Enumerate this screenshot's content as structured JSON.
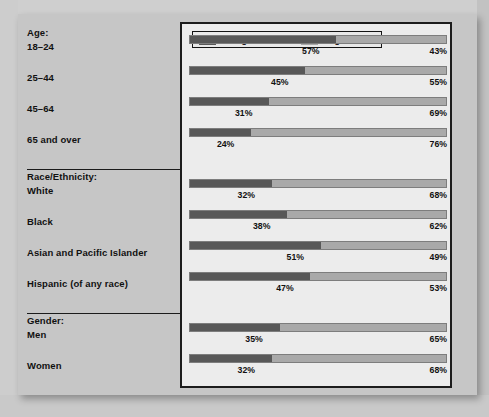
{
  "legend": {
    "items": [
      {
        "label": "Unregistered",
        "color": "#585858",
        "icon": "legend-swatch-unregistered"
      },
      {
        "label": "Registered",
        "color": "#a9a9a9",
        "icon": "legend-swatch-registered"
      }
    ]
  },
  "groups": [
    {
      "title": "Age:",
      "rows": [
        "18–24",
        "25–44",
        "45–64",
        "65 and over"
      ]
    },
    {
      "title": "Race/Ethnicity:",
      "rows": [
        "White",
        "Black",
        "Asian and Pacific Islander",
        "Hispanic (of any race)"
      ]
    },
    {
      "title": "Gender:",
      "rows": [
        "Men",
        "Women"
      ]
    }
  ],
  "chart_data": {
    "type": "bar",
    "subtype": "stacked-horizontal-100pct",
    "title": "",
    "xlabel": "",
    "ylabel": "",
    "xlim": [
      0,
      100
    ],
    "grid": false,
    "legend_position": "top-inside",
    "series": [
      {
        "name": "Unregistered",
        "color": "#585858",
        "values": [
          57,
          45,
          31,
          24,
          32,
          38,
          51,
          47,
          35,
          32
        ]
      },
      {
        "name": "Registered",
        "color": "#a9a9a9",
        "values": [
          43,
          55,
          69,
          76,
          68,
          62,
          49,
          53,
          65,
          68
        ]
      }
    ],
    "categories": [
      "18–24",
      "25–44",
      "45–64",
      "65 and over",
      "White",
      "Black",
      "Asian and Pacific Islander",
      "Hispanic (of any race)",
      "Men",
      "Women"
    ],
    "category_groups": [
      "Age:",
      "Age:",
      "Age:",
      "Age:",
      "Race/Ethnicity:",
      "Race/Ethnicity:",
      "Race/Ethnicity:",
      "Race/Ethnicity:",
      "Gender:",
      "Gender:"
    ],
    "data_labels": [
      {
        "category": "18–24",
        "left": "57%",
        "right": "43%"
      },
      {
        "category": "25–44",
        "left": "45%",
        "right": "55%"
      },
      {
        "category": "45–64",
        "left": "31%",
        "right": "69%"
      },
      {
        "category": "65 and over",
        "left": "24%",
        "right": "76%"
      },
      {
        "category": "White",
        "left": "32%",
        "right": "68%"
      },
      {
        "category": "Black",
        "left": "38%",
        "right": "62%"
      },
      {
        "category": "Asian and Pacific Islander",
        "left": "51%",
        "right": "49%"
      },
      {
        "category": "Hispanic (of any race)",
        "left": "47%",
        "right": "53%"
      },
      {
        "category": "Men",
        "left": "35%",
        "right": "65%"
      },
      {
        "category": "Women",
        "left": "32%",
        "right": "68%"
      }
    ]
  }
}
